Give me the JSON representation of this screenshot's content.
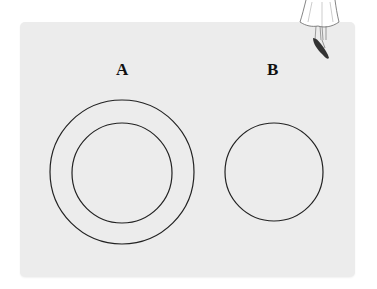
{
  "diagram": {
    "labels": {
      "a": "A",
      "b": "B"
    },
    "shapes": {
      "a_outer_circle": {
        "cx": 122,
        "cy": 172,
        "r": 72
      },
      "a_inner_circle": {
        "cx": 122,
        "cy": 173,
        "r": 50
      },
      "b_circle": {
        "cx": 274,
        "cy": 172,
        "r": 49
      }
    },
    "colors": {
      "panel": "#ececec",
      "stroke": "#222222",
      "figure_shoes": "#333333"
    }
  }
}
